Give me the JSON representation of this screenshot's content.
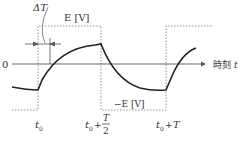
{
  "diagram": {
    "axis": {
      "zero_label": "0",
      "time_label_prefix": "時刻",
      "time_label_var": "t"
    },
    "labels": {
      "delta_t": "ΔT",
      "positive_level": "E [V]",
      "negative_level": "−E [V]",
      "t0": "t",
      "t0_sub": "0",
      "half_period_plus": "+",
      "half_period_num": "T",
      "half_period_den": "2",
      "full_period_plus": "+",
      "full_period_T": "T"
    },
    "colors": {
      "curve": "#222222",
      "axis": "#555555",
      "dotted": "#888888",
      "text": "#333333"
    }
  }
}
